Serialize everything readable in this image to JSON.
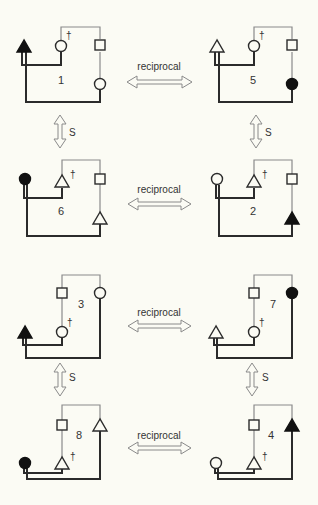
{
  "colors": {
    "background": "#fbfbf4",
    "thick_line": "#2b2b2b",
    "thin_line": "#8a8a8a",
    "symbol_stroke": "#2b2b2b",
    "filled_symbol": "#111111",
    "arrow_stroke": "#8a8a8a"
  },
  "labels": {
    "reciprocal": "reciprocal",
    "s": "S",
    "dagger": "†"
  },
  "diagrams": [
    {
      "id": "1",
      "number": "1",
      "layout": "upper",
      "ego": "triangle-filled",
      "dead": "circle",
      "top_right": "square",
      "lower_right": "circle"
    },
    {
      "id": "5",
      "number": "5",
      "layout": "upper",
      "ego": "triangle-open",
      "dead": "circle",
      "top_right": "square",
      "lower_right": "circle-filled"
    },
    {
      "id": "6",
      "number": "6",
      "layout": "upper",
      "ego": "circle-filled",
      "dead": "triangle",
      "top_right": "square",
      "lower_right": "triangle"
    },
    {
      "id": "2",
      "number": "2",
      "layout": "upper",
      "ego": "circle-open",
      "dead": "triangle",
      "top_right": "square",
      "lower_right": "triangle-filled"
    },
    {
      "id": "3",
      "number": "3",
      "layout": "lower",
      "ego": "triangle-filled",
      "dead": "circle",
      "top_left": "square",
      "top_right": "circle"
    },
    {
      "id": "7",
      "number": "7",
      "layout": "lower",
      "ego": "triangle-open",
      "dead": "circle",
      "top_left": "square",
      "top_right": "circle-filled"
    },
    {
      "id": "8",
      "number": "8",
      "layout": "lower",
      "ego": "circle-filled",
      "dead": "triangle",
      "top_left": "square",
      "top_right": "triangle"
    },
    {
      "id": "4",
      "number": "4",
      "layout": "lower",
      "ego": "circle-open",
      "dead": "triangle",
      "top_left": "square",
      "top_right": "triangle-filled"
    }
  ],
  "relations": [
    {
      "type": "reciprocal",
      "from": "1",
      "to": "5"
    },
    {
      "type": "reciprocal",
      "from": "6",
      "to": "2"
    },
    {
      "type": "reciprocal",
      "from": "3",
      "to": "7"
    },
    {
      "type": "reciprocal",
      "from": "8",
      "to": "4"
    },
    {
      "type": "S",
      "from": "1",
      "to": "6"
    },
    {
      "type": "S",
      "from": "5",
      "to": "2"
    },
    {
      "type": "S",
      "from": "3",
      "to": "8"
    },
    {
      "type": "S",
      "from": "7",
      "to": "4"
    }
  ]
}
